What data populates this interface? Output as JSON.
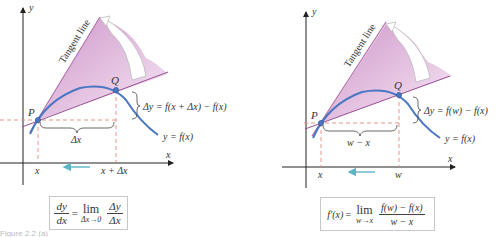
{
  "left_panel": {
    "axis_x": "x",
    "axis_y": "y",
    "tangent_label": "Tangent line",
    "point_p": "P",
    "point_q": "Q",
    "delta_y_label": "Δy = f(x + Δx) − f(x)",
    "curve_label": "y = f(x)",
    "delta_x_label": "Δx",
    "tick_x": "x",
    "tick_x2": "x + Δx",
    "formula": {
      "lhs_num": "dy",
      "lhs_den": "dx",
      "equals": "=",
      "lim": "lim",
      "lim_sub": "Δx→0",
      "rhs_num": "Δy",
      "rhs_den": "Δx"
    }
  },
  "right_panel": {
    "axis_x": "x",
    "axis_y": "y",
    "tangent_label": "Tangent line",
    "point_p": "P",
    "point_q": "Q",
    "delta_y_label": "Δy = f(w) − f(x)",
    "curve_label": "y = f(x)",
    "delta_x_label": "w − x",
    "tick_x": "x",
    "tick_x2": "w",
    "formula": {
      "lhs": "f′(x)",
      "equals": "=",
      "lim": "lim",
      "lim_sub": "w→x",
      "rhs_num": "f(w) − f(x)",
      "rhs_den": "w − x"
    }
  },
  "caption": "Figure 2.2 (a)",
  "colors": {
    "curve": "#4a76c2",
    "secant": "#9a4f95",
    "tangent": "#b06aa8",
    "fill": "#d7a6d3",
    "dashed": "#e08a7a",
    "arrow": "#5bb6c4",
    "axis": "#222222"
  }
}
